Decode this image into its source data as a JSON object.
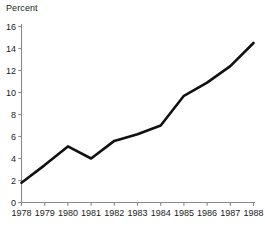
{
  "chart_data": {
    "type": "line",
    "title": "",
    "subtitle": "",
    "xlabel": "",
    "ylabel": "Percent",
    "ylabel_position": "top-left",
    "grid": false,
    "legend": false,
    "legend_position": "none",
    "line_color": "#111111",
    "axis_color": "#8a8a8a",
    "background_color": "#ffffff",
    "xlim": [
      1978,
      1988
    ],
    "ylim": [
      0,
      16
    ],
    "ytick_step": 2,
    "categories": [
      "1978",
      "1979",
      "1980",
      "1981",
      "1982",
      "1983",
      "1984",
      "1985",
      "1986",
      "1987",
      "1988"
    ],
    "x": [
      1978,
      1979,
      1980,
      1981,
      1982,
      1983,
      1984,
      1985,
      1986,
      1987,
      1988
    ],
    "values": [
      1.8,
      3.4,
      5.1,
      4.0,
      5.6,
      6.2,
      7.0,
      9.7,
      10.9,
      12.4,
      14.5
    ],
    "yticks": [
      0,
      2,
      4,
      6,
      8,
      10,
      12,
      14,
      16
    ],
    "ytick_labels": [
      "0",
      "2",
      "4",
      "6",
      "8",
      "10",
      "12",
      "14",
      "16"
    ],
    "xtick_labels": [
      "1978",
      "1979",
      "1980",
      "1981",
      "1982",
      "1983",
      "1984",
      "1985",
      "1986",
      "1987",
      "1988"
    ],
    "series": [
      {
        "name": "Percent",
        "values": [
          1.8,
          3.4,
          5.1,
          4.0,
          5.6,
          6.2,
          7.0,
          9.7,
          10.9,
          12.4,
          14.5
        ]
      }
    ]
  },
  "axes": {
    "y_axis_title": "Percent"
  }
}
